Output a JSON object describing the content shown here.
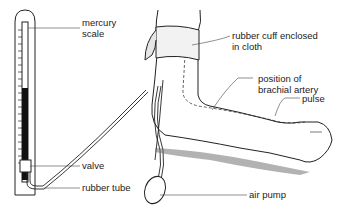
{
  "diagram": {
    "labels": {
      "mercury_scale_line1": "mercury",
      "mercury_scale_line2": "scale",
      "cuff_line1": "rubber cuff enclosed",
      "cuff_line2": "in cloth",
      "artery_line1": "position of",
      "artery_line2": "brachial artery",
      "pulse": "pulse",
      "valve": "valve",
      "rubber_tube": "rubber tube",
      "air_pump": "air pump"
    },
    "colors": {
      "line": "#222222",
      "mercury": "#111111",
      "cuff_fill": "#f2f2f2",
      "shadow": "#555555"
    }
  }
}
